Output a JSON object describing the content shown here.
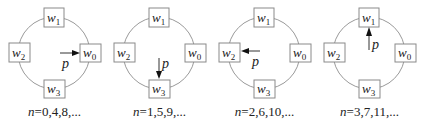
{
  "panels": [
    {
      "nodes": [
        {
          "name": "w",
          "sub": "1",
          "pos": "top"
        },
        {
          "name": "w",
          "sub": "2",
          "pos": "left"
        },
        {
          "name": "w",
          "sub": "0",
          "pos": "right"
        },
        {
          "name": "w",
          "sub": "3",
          "pos": "bottom"
        }
      ],
      "pointer": {
        "label": "p",
        "target": "w0",
        "direction": "right"
      },
      "caption": {
        "var": "n",
        "text": "=0,4,8,..."
      }
    },
    {
      "nodes": [
        {
          "name": "w",
          "sub": "1",
          "pos": "top"
        },
        {
          "name": "w",
          "sub": "2",
          "pos": "left"
        },
        {
          "name": "w",
          "sub": "0",
          "pos": "right"
        },
        {
          "name": "w",
          "sub": "3",
          "pos": "bottom"
        }
      ],
      "pointer": {
        "label": "p",
        "target": "w3",
        "direction": "down"
      },
      "caption": {
        "var": "n",
        "text": "=1,5,9,..."
      }
    },
    {
      "nodes": [
        {
          "name": "w",
          "sub": "1",
          "pos": "top"
        },
        {
          "name": "w",
          "sub": "2",
          "pos": "left"
        },
        {
          "name": "w",
          "sub": "0",
          "pos": "right"
        },
        {
          "name": "w",
          "sub": "3",
          "pos": "bottom"
        }
      ],
      "pointer": {
        "label": "p",
        "target": "w2",
        "direction": "left"
      },
      "caption": {
        "var": "n",
        "text": "=2,6,10,..."
      }
    },
    {
      "nodes": [
        {
          "name": "w",
          "sub": "1",
          "pos": "top"
        },
        {
          "name": "w",
          "sub": "2",
          "pos": "left"
        },
        {
          "name": "w",
          "sub": "0",
          "pos": "right"
        },
        {
          "name": "w",
          "sub": "3",
          "pos": "bottom"
        }
      ],
      "pointer": {
        "label": "p",
        "target": "w1",
        "direction": "up"
      },
      "caption": {
        "var": "n",
        "text": "=3,7,11,..."
      }
    }
  ],
  "colors": {
    "ring": "#9a9a9a",
    "box_border": "#8a8a8a",
    "arrow": "#111111",
    "text": "#222222"
  }
}
